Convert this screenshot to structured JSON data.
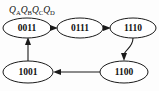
{
  "figure": {
    "type": "state-transition-diagram",
    "variable_label": {
      "full_text": "QAQBQCQD",
      "parts": [
        {
          "base": "Q",
          "sub": "A"
        },
        {
          "base": "Q",
          "sub": "B"
        },
        {
          "base": "Q",
          "sub": "C"
        },
        {
          "base": "Q",
          "sub": "D"
        }
      ]
    },
    "colors": {
      "background": "#fdfdfd",
      "node_fill": "#ffffff",
      "stroke": "#1a1a1a",
      "text": "#111111"
    },
    "nodes": [
      {
        "id": "n0",
        "label": "0011",
        "cx": 27,
        "cy": 28,
        "rx": 24,
        "ry": 10
      },
      {
        "id": "n1",
        "label": "0111",
        "cx": 80,
        "cy": 28,
        "rx": 23,
        "ry": 10
      },
      {
        "id": "n2",
        "label": "1110",
        "cx": 133,
        "cy": 28,
        "rx": 23,
        "ry": 10
      },
      {
        "id": "n3",
        "label": "1100",
        "cx": 124,
        "cy": 72,
        "rx": 24,
        "ry": 11
      },
      {
        "id": "n4",
        "label": "1001",
        "cx": 28,
        "cy": 72,
        "rx": 25,
        "ry": 11
      }
    ],
    "edges": [
      {
        "from": "0011",
        "to": "0111",
        "direction": "right"
      },
      {
        "from": "0111",
        "to": "1110",
        "direction": "right"
      },
      {
        "from": "1110",
        "to": "1100",
        "direction": "down"
      },
      {
        "from": "1100",
        "to": "1001",
        "direction": "left"
      },
      {
        "from": "1001",
        "to": "0011",
        "direction": "up"
      }
    ]
  }
}
